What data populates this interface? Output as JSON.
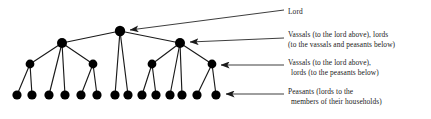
{
  "diagram": {
    "colors": {
      "node_fill": "#000000",
      "edge_stroke": "#1a1a1a",
      "arrow_stroke": "#1a1a1a",
      "text": "#1a1a1a",
      "background": "#ffffff"
    },
    "labels": {
      "lord": {
        "name": "lord-label",
        "lines": [
          "Lord"
        ]
      },
      "vassals_upper": {
        "name": "vassals-upper-label",
        "lines": [
          "Vassals (to the lord above), lords",
          "(to the vassals and peasants below)"
        ]
      },
      "vassals_lower": {
        "name": "vassals-lower-label",
        "lines": [
          "Vassals (to the lord above),",
          "lords (to the peasants below)"
        ]
      },
      "peasants": {
        "name": "peasants-label",
        "lines": [
          "Peasants (lords to the",
          "members of their households)"
        ]
      }
    },
    "levels": [
      {
        "name": "level-1-lord",
        "y": 31,
        "radius": 5.2,
        "x": [
          120
        ]
      },
      {
        "name": "level-2-great-vassals",
        "y": 43,
        "radius": 5.0,
        "x": [
          62,
          180
        ]
      },
      {
        "name": "level-3-lesser-vassals",
        "y": 64,
        "radius": 4.4,
        "x": [
          30,
          93,
          152,
          212
        ]
      },
      {
        "name": "level-4-peasants",
        "y": 95,
        "radius": 4.6,
        "x": [
          17,
          32,
          49,
          65,
          81,
          97,
          115,
          128,
          142,
          156,
          170,
          182,
          197,
          216
        ]
      }
    ],
    "edges": [
      [
        120,
        31,
        62,
        43
      ],
      [
        120,
        31,
        180,
        43
      ],
      [
        120,
        31,
        115,
        95
      ],
      [
        120,
        31,
        128,
        95
      ],
      [
        62,
        43,
        30,
        64
      ],
      [
        62,
        43,
        93,
        64
      ],
      [
        62,
        43,
        49,
        95
      ],
      [
        62,
        43,
        65,
        95
      ],
      [
        180,
        43,
        152,
        64
      ],
      [
        180,
        43,
        212,
        64
      ],
      [
        180,
        43,
        170,
        95
      ],
      [
        180,
        43,
        182,
        95
      ],
      [
        30,
        64,
        17,
        95
      ],
      [
        30,
        64,
        32,
        95
      ],
      [
        93,
        64,
        81,
        95
      ],
      [
        93,
        64,
        97,
        95
      ],
      [
        152,
        64,
        142,
        95
      ],
      [
        152,
        64,
        156,
        95
      ],
      [
        212,
        64,
        197,
        95
      ],
      [
        212,
        64,
        216,
        95
      ]
    ],
    "arrows": [
      {
        "name": "arrow-to-lord",
        "x1": 284,
        "y1": 10,
        "x2": 128,
        "y2": 30
      },
      {
        "name": "arrow-to-vassals-upper",
        "x1": 284,
        "y1": 38,
        "x2": 188,
        "y2": 42
      },
      {
        "name": "arrow-to-vassals-lower",
        "x1": 284,
        "y1": 65,
        "x2": 220,
        "y2": 65
      },
      {
        "name": "arrow-to-peasants",
        "x1": 284,
        "y1": 94,
        "x2": 225,
        "y2": 94
      }
    ]
  }
}
